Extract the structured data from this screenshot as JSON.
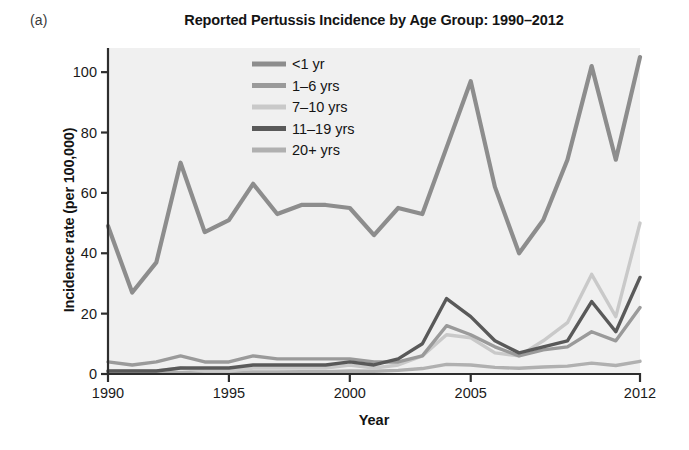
{
  "figure": {
    "panel_label": "(a)",
    "background_color": "#ffffff",
    "plot_background_color": "#f0f0f0"
  },
  "chart_data": {
    "type": "line",
    "title": "Reported Pertussis Incidence by Age Group: 1990–2012",
    "xlabel": "Year",
    "ylabel": "Incidence rate (per 100,000)",
    "xlim": [
      1990,
      2012
    ],
    "ylim": [
      0,
      108
    ],
    "grid": false,
    "legend_position": "top-center-right",
    "x": [
      1990,
      1991,
      1992,
      1993,
      1994,
      1995,
      1996,
      1997,
      1998,
      1999,
      2000,
      2001,
      2002,
      2003,
      2004,
      2005,
      2006,
      2007,
      2008,
      2009,
      2010,
      2011,
      2012
    ],
    "xticks": [
      1990,
      1995,
      2000,
      2005,
      2012
    ],
    "xtick_labels": [
      "1990",
      "1995",
      "2000",
      "2005",
      "2012"
    ],
    "yticks": [
      0,
      20,
      40,
      60,
      80,
      100
    ],
    "ytick_labels": [
      "0",
      "20",
      "40",
      "60",
      "80",
      "100"
    ],
    "series": [
      {
        "name": "<1 yr",
        "color": "#8d8d8d",
        "values": [
          49,
          27,
          37,
          70,
          47,
          51,
          63,
          53,
          56,
          56,
          55,
          46,
          55,
          53,
          75,
          97,
          62,
          40,
          51,
          71,
          102,
          71,
          105
        ]
      },
      {
        "name": "1–6 yrs",
        "color": "#9a9a9a",
        "values": [
          4,
          3,
          4,
          6,
          4,
          4,
          6,
          5,
          5,
          5,
          5,
          4,
          4,
          6,
          16,
          13,
          9,
          6,
          8,
          9,
          14,
          11,
          22
        ]
      },
      {
        "name": "7–10 yrs",
        "color": "#c9c9c9",
        "values": [
          1,
          1,
          1,
          2,
          1,
          1,
          2,
          2,
          2,
          2,
          3,
          2,
          3,
          6,
          13,
          12,
          7,
          6,
          11,
          17,
          33,
          19,
          50
        ]
      },
      {
        "name": "11–19 yrs",
        "color": "#595959",
        "values": [
          1,
          1,
          1,
          2,
          2,
          2,
          3,
          3,
          3,
          3,
          4,
          3,
          5,
          10,
          25,
          19,
          11,
          7,
          9,
          11,
          24,
          14,
          32
        ]
      },
      {
        "name": "20+ yrs",
        "color": "#b0b0b0",
        "values": [
          0.3,
          0.3,
          0.4,
          0.5,
          0.5,
          0.5,
          0.7,
          0.7,
          0.8,
          0.8,
          1.0,
          0.9,
          1.2,
          1.8,
          3.2,
          3.0,
          2.2,
          1.9,
          2.3,
          2.6,
          3.6,
          2.8,
          4.2
        ]
      }
    ]
  }
}
